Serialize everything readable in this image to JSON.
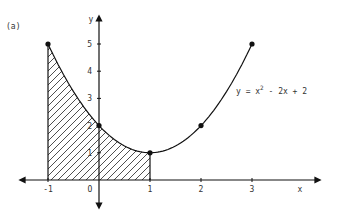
{
  "panel_label": "(a)",
  "equation": {
    "prefix": "y = x",
    "exponent": "2",
    "suffix": " - 2x + 2"
  },
  "axes": {
    "x_label": "x",
    "y_label": "y",
    "origin_label": "O"
  },
  "x_ticks": [
    {
      "value": -1,
      "label": "-1"
    },
    {
      "value": 1,
      "label": "1"
    },
    {
      "value": 2,
      "label": "2"
    },
    {
      "value": 3,
      "label": "3"
    }
  ],
  "y_ticks": [
    {
      "value": 1,
      "label": "1"
    },
    {
      "value": 2,
      "label": "2"
    },
    {
      "value": 3,
      "label": "3"
    },
    {
      "value": 4,
      "label": "4"
    },
    {
      "value": 5,
      "label": "5"
    }
  ],
  "chart_data": {
    "type": "line",
    "title": "",
    "function": "y = x^2 - 2x + 2",
    "xlabel": "x",
    "ylabel": "y",
    "x": [
      -1,
      0,
      1,
      2,
      3
    ],
    "series": [
      {
        "name": "y = x^2 - 2x + 2",
        "values": [
          5,
          2,
          1,
          2,
          5
        ]
      }
    ],
    "marked_points": [
      [
        -1,
        5
      ],
      [
        0,
        2
      ],
      [
        1,
        1
      ],
      [
        2,
        2
      ],
      [
        3,
        5
      ]
    ],
    "shaded_region": {
      "from_x": -1,
      "to_x": 1,
      "pattern": "diagonal hatch",
      "description": "area under curve between x=-1 and x=1"
    },
    "xlim": [
      -1.9,
      3.9
    ],
    "ylim": [
      -0.6,
      5.8
    ],
    "grid": false,
    "legend": "none"
  }
}
